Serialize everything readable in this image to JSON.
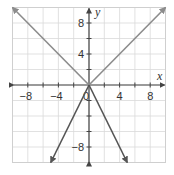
{
  "chart_data": {
    "type": "line",
    "title": "",
    "xlabel": "x",
    "ylabel": "y",
    "xlim": [
      -10,
      10
    ],
    "ylim": [
      -10,
      10
    ],
    "grid": true,
    "grid_step": 2,
    "x_ticks": [
      -8,
      -4,
      0,
      4,
      8
    ],
    "y_ticks": [
      8,
      4,
      -8
    ],
    "x_tick_labels": [
      "−8",
      "−4",
      "0",
      "4",
      "8"
    ],
    "y_tick_labels": [
      "8",
      "4",
      "−8"
    ],
    "origin_label": "0",
    "series": [
      {
        "name": "y = |x|",
        "color": "#8c8c8c",
        "points": [
          [
            -10,
            10
          ],
          [
            0,
            0
          ],
          [
            10,
            10
          ]
        ]
      },
      {
        "name": "y = -2|x|",
        "color": "#555555",
        "points": [
          [
            -5,
            -10
          ],
          [
            0,
            0
          ],
          [
            5,
            -10
          ]
        ]
      }
    ]
  },
  "colors": {
    "grid": "#d9d9d9",
    "axis": "#444444",
    "border": "#cfcfcf"
  }
}
